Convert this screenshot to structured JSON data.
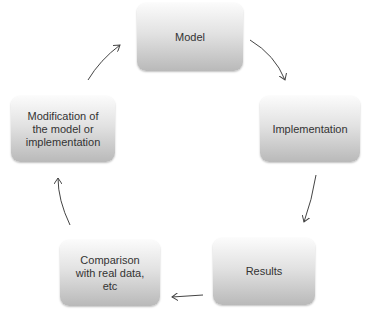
{
  "diagram": {
    "type": "cycle",
    "nodes": [
      {
        "id": "model",
        "label": "Model"
      },
      {
        "id": "implementation",
        "label": "Implementation"
      },
      {
        "id": "results",
        "label": "Results"
      },
      {
        "id": "comparison",
        "label": "Comparison\nwith real data,\netc"
      },
      {
        "id": "modification",
        "label": "Modification of\nthe model or\nimplementation"
      }
    ],
    "edges": [
      {
        "from": "model",
        "to": "implementation"
      },
      {
        "from": "implementation",
        "to": "results"
      },
      {
        "from": "results",
        "to": "comparison"
      },
      {
        "from": "comparison",
        "to": "modification"
      },
      {
        "from": "modification",
        "to": "model"
      }
    ]
  }
}
